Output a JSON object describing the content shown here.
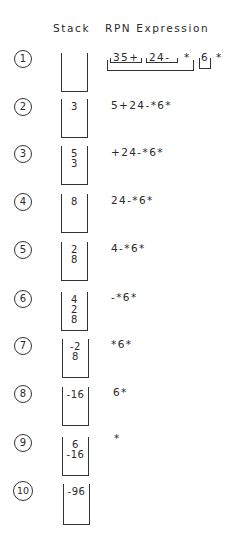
{
  "headers": {
    "stack": "Stack",
    "rpn": "RPN Expression"
  },
  "row1": {
    "step": "1",
    "stack": [],
    "groups": {
      "g1": "35+",
      "g2": "24-",
      "op1": "*",
      "g3": "6",
      "op2": "*"
    }
  },
  "rows": [
    {
      "step": "2",
      "stack": [
        "3"
      ],
      "expr": "5+24-*6*"
    },
    {
      "step": "3",
      "stack": [
        "5",
        "3"
      ],
      "expr": "+24-*6*"
    },
    {
      "step": "4",
      "stack": [
        "8"
      ],
      "expr": "24-*6*"
    },
    {
      "step": "5",
      "stack": [
        "2",
        "8"
      ],
      "expr": "4-*6*"
    },
    {
      "step": "6",
      "stack": [
        "4",
        "2",
        "8"
      ],
      "expr": "-*6*"
    },
    {
      "step": "7",
      "stack": [
        "-2",
        "8"
      ],
      "expr": "*6*"
    },
    {
      "step": "8",
      "stack": [
        "-16"
      ],
      "expr": "6*"
    },
    {
      "step": "9",
      "stack": [
        "6",
        "-16"
      ],
      "expr": "*"
    },
    {
      "step": "10",
      "stack": [
        "-96"
      ],
      "expr": ""
    }
  ]
}
